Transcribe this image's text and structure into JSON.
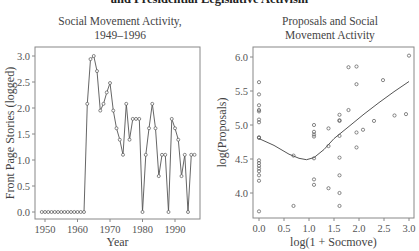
{
  "figure": {
    "title": "and Presidential Legislative Activism"
  },
  "chart_data": [
    {
      "type": "line",
      "title": "Social Movement Activity,\n1949–1996",
      "title_lines": [
        "Social Movement Activity,",
        "1949–1996"
      ],
      "xlabel": "Year",
      "ylabel": "Front Page Stories (logged)",
      "xlim": [
        1948,
        1998
      ],
      "ylim": [
        -0.1,
        3.05
      ],
      "xticks": [
        1950,
        1960,
        1970,
        1980,
        1990
      ],
      "yticks": [
        "0.0",
        "0.5",
        "1.0",
        "1.5",
        "2.0",
        "2.5",
        "3.0"
      ],
      "grid": false,
      "marker": "circle-open",
      "x": [
        1949,
        1950,
        1951,
        1952,
        1953,
        1954,
        1955,
        1956,
        1957,
        1958,
        1959,
        1960,
        1961,
        1962,
        1963,
        1964,
        1965,
        1966,
        1967,
        1968,
        1969,
        1970,
        1971,
        1972,
        1973,
        1974,
        1975,
        1976,
        1977,
        1978,
        1979,
        1980,
        1981,
        1982,
        1983,
        1984,
        1985,
        1986,
        1987,
        1988,
        1989,
        1990,
        1991,
        1992,
        1993,
        1994,
        1995,
        1996
      ],
      "values": [
        0,
        0,
        0,
        0,
        0,
        0,
        0,
        0,
        0,
        0,
        0,
        0,
        0,
        0,
        2.08,
        2.94,
        3.0,
        2.71,
        1.95,
        2.08,
        2.3,
        2.48,
        1.95,
        1.61,
        1.39,
        1.1,
        2.08,
        1.39,
        1.79,
        1.79,
        1.79,
        0,
        1.1,
        1.61,
        2.08,
        1.61,
        0.69,
        1.1,
        1.1,
        0,
        1.79,
        1.61,
        1.39,
        0.69,
        1.1,
        0,
        1.1,
        1.1
      ]
    },
    {
      "type": "scatter",
      "title": "Proposals and Social\nMovement Activity",
      "title_lines": [
        "Proposals and Social",
        "Movement Activity"
      ],
      "xlabel": "log(1 + Socmove)",
      "ylabel": "log(Proposals)",
      "xlim": [
        -0.12,
        3.1
      ],
      "ylim": [
        3.65,
        6.08
      ],
      "xticks": [
        "0.0",
        "0.5",
        "1.0",
        "1.5",
        "2.0",
        "2.5",
        "3.0"
      ],
      "yticks": [
        "4.0",
        "4.5",
        "5.0",
        "5.5",
        "6.0"
      ],
      "grid": false,
      "marker": "circle-open",
      "points": [
        [
          0.0,
          5.63
        ],
        [
          0.0,
          5.45
        ],
        [
          0.0,
          5.29
        ],
        [
          0.0,
          5.22
        ],
        [
          0.0,
          5.2
        ],
        [
          0.0,
          5.08
        ],
        [
          0.0,
          5.04
        ],
        [
          0.0,
          4.82
        ],
        [
          0.0,
          4.81
        ],
        [
          0.0,
          4.48
        ],
        [
          0.0,
          4.44
        ],
        [
          0.0,
          4.4
        ],
        [
          0.0,
          4.36
        ],
        [
          0.0,
          4.32
        ],
        [
          0.0,
          4.26
        ],
        [
          0.0,
          4.18
        ],
        [
          0.0,
          3.73
        ],
        [
          0.69,
          4.55
        ],
        [
          0.69,
          3.81
        ],
        [
          1.1,
          5.0
        ],
        [
          1.1,
          4.9
        ],
        [
          1.1,
          4.86
        ],
        [
          1.1,
          4.83
        ],
        [
          1.1,
          4.51
        ],
        [
          1.1,
          4.2
        ],
        [
          1.1,
          4.12
        ],
        [
          1.39,
          4.95
        ],
        [
          1.39,
          4.69
        ],
        [
          1.39,
          4.07
        ],
        [
          1.61,
          5.15
        ],
        [
          1.61,
          5.07
        ],
        [
          1.61,
          5.06
        ],
        [
          1.61,
          4.84
        ],
        [
          1.61,
          4.52
        ],
        [
          1.61,
          4.26
        ],
        [
          1.61,
          4.0
        ],
        [
          1.61,
          3.81
        ],
        [
          1.79,
          5.85
        ],
        [
          1.79,
          5.22
        ],
        [
          1.95,
          5.86
        ],
        [
          1.95,
          5.6
        ],
        [
          1.95,
          4.89
        ],
        [
          1.95,
          4.67
        ],
        [
          2.08,
          4.93
        ],
        [
          2.3,
          5.06
        ],
        [
          2.48,
          5.66
        ],
        [
          2.71,
          5.14
        ],
        [
          2.94,
          5.16
        ],
        [
          3.0,
          6.02
        ]
      ],
      "smoother": {
        "type": "lowess",
        "x": [
          0.0,
          0.3,
          0.6,
          0.8,
          0.95,
          1.1,
          1.3,
          1.5,
          1.8,
          2.1,
          2.4,
          2.7,
          3.0
        ],
        "y": [
          4.8,
          4.7,
          4.57,
          4.51,
          4.49,
          4.52,
          4.64,
          4.8,
          4.98,
          5.16,
          5.33,
          5.49,
          5.64
        ]
      }
    }
  ]
}
